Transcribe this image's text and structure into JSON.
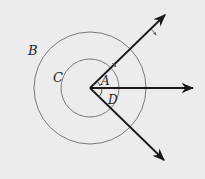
{
  "diagram": {
    "title": "",
    "colors": {
      "background": "#ececec",
      "ray": "#1a1a1a",
      "circle": "#777777",
      "label": "#222222"
    },
    "vertex": {
      "x": 90,
      "y": 88
    },
    "circles": [
      {
        "id": "inner",
        "label": "C",
        "radius": 29
      },
      {
        "id": "outer",
        "label": "B",
        "radius": 56
      }
    ],
    "rays": [
      {
        "id": "upper",
        "end": {
          "x": 165,
          "y": 15
        }
      },
      {
        "id": "horizontal",
        "end": {
          "x": 193,
          "y": 88
        }
      },
      {
        "id": "lower",
        "end": {
          "x": 164,
          "y": 160
        }
      }
    ],
    "labels": {
      "A": "A",
      "B": "B",
      "C": "C",
      "D": "D"
    },
    "angles": [
      {
        "label": "A",
        "between": [
          "upper",
          "horizontal"
        ]
      },
      {
        "label": "D",
        "between": [
          "horizontal",
          "lower"
        ]
      }
    ]
  }
}
